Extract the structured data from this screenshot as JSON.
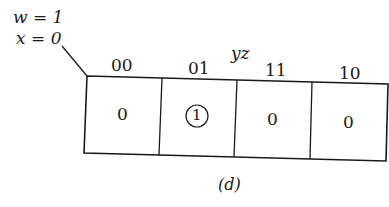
{
  "diagram": {
    "type": "karnaugh-map",
    "fixed_vars": [
      {
        "name": "w",
        "value": "1",
        "text": "w = 1"
      },
      {
        "name": "x",
        "value": "0",
        "text": "x = 0"
      }
    ],
    "column_var_label": "yz",
    "columns": [
      "00",
      "01",
      "11",
      "10"
    ],
    "cells": [
      {
        "col": "00",
        "value": "0",
        "circled": false
      },
      {
        "col": "01",
        "value": "1",
        "circled": true
      },
      {
        "col": "11",
        "value": "0",
        "circled": false
      },
      {
        "col": "10",
        "value": "0",
        "circled": false
      }
    ],
    "caption": "(d)"
  },
  "colors": {
    "ink": "#1a1a1a",
    "background": "#ffffff"
  }
}
